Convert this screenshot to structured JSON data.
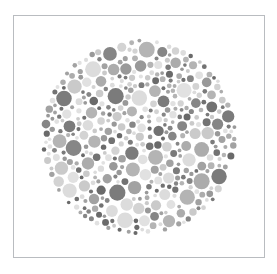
{
  "page": {
    "kind": "pseudoisochromatic-plate",
    "caption": ""
  },
  "card": {
    "background_color": "#ffffff",
    "border_color": "#b9bcc0",
    "x": 13,
    "y": 15,
    "width": 252,
    "height": 243
  },
  "plate": {
    "center_x": 139,
    "center_y": 137,
    "radius": 99,
    "background_color": "#ffffff",
    "dot_count": 560,
    "dot_radius_min": 1.8,
    "dot_radius_max": 8.2,
    "dot_gap": 0.7,
    "random_seed": 20240711
  },
  "palette": {
    "light": [
      "#dcdcdc",
      "#d3d3d3",
      "#cacaca",
      "#e1e1e1"
    ],
    "medium": [
      "#acacac",
      "#a2a2a2",
      "#b4b4b4",
      "#999999"
    ],
    "dark": [
      "#7b7b7b",
      "#727272",
      "#868686",
      "#6a6a6a"
    ],
    "light_weight": 0.34,
    "medium_weight": 0.34,
    "dark_weight": 0.32
  },
  "chart_data": {
    "type": "scatter",
    "xlabel": "",
    "ylabel": "",
    "xlim": [
      40,
      238
    ],
    "ylim": [
      38,
      236
    ],
    "grid": false,
    "legend": "none",
    "series": [
      {
        "name": "light-dots",
        "color": "#d7d7d7",
        "approx_count": 190
      },
      {
        "name": "medium-dots",
        "color": "#a8a8a8",
        "approx_count": 190
      },
      {
        "name": "dark-dots",
        "color": "#7a7a7a",
        "approx_count": 180
      }
    ],
    "annotations": []
  }
}
